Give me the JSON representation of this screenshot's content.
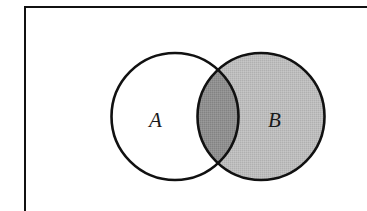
{
  "diagram": {
    "type": "venn",
    "frame": {
      "stroke_color": "#111111",
      "visible_edges": [
        "top",
        "left"
      ]
    },
    "sets": [
      {
        "id": "A",
        "label": "A",
        "fill": "#ffffff",
        "stroke": "#111111",
        "shaded": false
      },
      {
        "id": "B",
        "label": "B",
        "fill": "#b9b9b9",
        "stroke": "#111111",
        "shaded": true
      }
    ],
    "intersection": {
      "label": "A ∩ B",
      "fill": "#8e8e8e",
      "shaded": true
    },
    "shaded_region": "B"
  },
  "colors": {
    "background": "#ffffff",
    "outline": "#111111",
    "set_b_fill": "#b9b9b9",
    "intersection_fill": "#8e8e8e"
  }
}
